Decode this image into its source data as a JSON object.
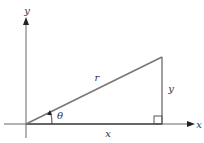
{
  "diagram": {
    "type": "right-triangle-polar",
    "colors": {
      "axis": "#555555",
      "triangle": "#777777",
      "text": "#333333",
      "background": "#ffffff"
    },
    "axes": {
      "x_label": "x",
      "y_label": "y"
    },
    "triangle": {
      "hypotenuse_label": "r",
      "opposite_label": "y",
      "adjacent_label": "x",
      "angle_label": "θ",
      "right_angle_marker": true
    }
  }
}
